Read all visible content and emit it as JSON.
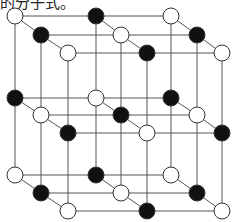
{
  "caption": "的分子式。",
  "diagram": {
    "type": "crystal-lattice-3x3x3",
    "colors": {
      "line": "#555555",
      "black_atom": "#111111",
      "white_atom": "#ffffff",
      "atom_stroke": "#333333"
    },
    "atom_radius": 8,
    "columns_x": [
      [
        15,
        96,
        171
      ],
      [
        41,
        121,
        197
      ],
      [
        68,
        147,
        222
      ]
    ],
    "layers_y": [
      [
        16,
        35,
        53
      ],
      [
        98,
        115,
        133
      ],
      [
        175,
        193,
        211
      ]
    ],
    "atoms": [
      {
        "layer": 0,
        "row": 0,
        "col": 0,
        "color": "white"
      },
      {
        "layer": 0,
        "row": 0,
        "col": 1,
        "color": "black"
      },
      {
        "layer": 0,
        "row": 0,
        "col": 2,
        "color": "white"
      },
      {
        "layer": 0,
        "row": 1,
        "col": 0,
        "color": "black"
      },
      {
        "layer": 0,
        "row": 1,
        "col": 1,
        "color": "white"
      },
      {
        "layer": 0,
        "row": 1,
        "col": 2,
        "color": "black"
      },
      {
        "layer": 0,
        "row": 2,
        "col": 0,
        "color": "white"
      },
      {
        "layer": 0,
        "row": 2,
        "col": 1,
        "color": "black"
      },
      {
        "layer": 0,
        "row": 2,
        "col": 2,
        "color": "white"
      },
      {
        "layer": 1,
        "row": 0,
        "col": 0,
        "color": "black"
      },
      {
        "layer": 1,
        "row": 0,
        "col": 1,
        "color": "white"
      },
      {
        "layer": 1,
        "row": 0,
        "col": 2,
        "color": "black"
      },
      {
        "layer": 1,
        "row": 1,
        "col": 0,
        "color": "white"
      },
      {
        "layer": 1,
        "row": 1,
        "col": 1,
        "color": "black"
      },
      {
        "layer": 1,
        "row": 1,
        "col": 2,
        "color": "white"
      },
      {
        "layer": 1,
        "row": 2,
        "col": 0,
        "color": "black"
      },
      {
        "layer": 1,
        "row": 2,
        "col": 1,
        "color": "white"
      },
      {
        "layer": 1,
        "row": 2,
        "col": 2,
        "color": "black"
      },
      {
        "layer": 2,
        "row": 0,
        "col": 0,
        "color": "white"
      },
      {
        "layer": 2,
        "row": 0,
        "col": 1,
        "color": "black"
      },
      {
        "layer": 2,
        "row": 0,
        "col": 2,
        "color": "white"
      },
      {
        "layer": 2,
        "row": 1,
        "col": 0,
        "color": "black"
      },
      {
        "layer": 2,
        "row": 1,
        "col": 1,
        "color": "white"
      },
      {
        "layer": 2,
        "row": 1,
        "col": 2,
        "color": "black"
      },
      {
        "layer": 2,
        "row": 2,
        "col": 0,
        "color": "white"
      },
      {
        "layer": 2,
        "row": 2,
        "col": 1,
        "color": "black"
      },
      {
        "layer": 2,
        "row": 2,
        "col": 2,
        "color": "white"
      }
    ]
  }
}
